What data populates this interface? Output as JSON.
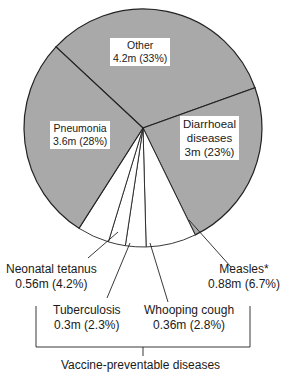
{
  "chart_data": {
    "type": "pie",
    "title": "",
    "unit": "deaths (millions)",
    "slices": [
      {
        "label": "Other",
        "value": 4.2,
        "percent": 33,
        "display": "4.2m (33%)",
        "fill": "#a9a9a9"
      },
      {
        "label": "Diarrhoeal diseases",
        "value": 3.0,
        "percent": 23,
        "display": "3m (23%)",
        "fill": "#a9a9a9"
      },
      {
        "label": "Measles*",
        "value": 0.88,
        "percent": 6.7,
        "display": "0.88m (6.7%)",
        "fill": "#ffffff"
      },
      {
        "label": "Whooping cough",
        "value": 0.36,
        "percent": 2.8,
        "display": "0.36m (2.8%)",
        "fill": "#ffffff"
      },
      {
        "label": "Tuberculosis",
        "value": 0.3,
        "percent": 2.3,
        "display": "0.3m (2.3%)",
        "fill": "#ffffff"
      },
      {
        "label": "Neonatal tetanus",
        "value": 0.56,
        "percent": 4.2,
        "display": "0.56m (4.2%)",
        "fill": "#ffffff"
      },
      {
        "label": "Pneumonia",
        "value": 3.6,
        "percent": 28,
        "display": "3.6m (28%)",
        "fill": "#a9a9a9"
      }
    ],
    "group_annotation": {
      "label": "Vaccine-preventable diseases",
      "members": [
        "Measles*",
        "Whooping cough",
        "Tuberculosis",
        "Neonatal tetanus"
      ]
    },
    "legend": "none"
  },
  "labels": {
    "other": {
      "name": "Other",
      "value": "4.2m (33%)"
    },
    "pneumonia": {
      "name": "Pneumonia",
      "value": "3.6m (28%)"
    },
    "diarrhoeal": {
      "name1": "Diarrhoeal",
      "name2": "diseases",
      "value": "3m (23%)"
    },
    "neonatal": {
      "name": "Neonatal tetanus",
      "value": "0.56m (4.2%)"
    },
    "tuberculosis": {
      "name": "Tuberculosis",
      "value": "0.3m (2.3%)"
    },
    "whooping": {
      "name": "Whooping cough",
      "value": "0.36m (2.8%)"
    },
    "measles": {
      "name": "Measles*",
      "value": "0.88m (6.7%)"
    },
    "group": "Vaccine-preventable diseases"
  }
}
